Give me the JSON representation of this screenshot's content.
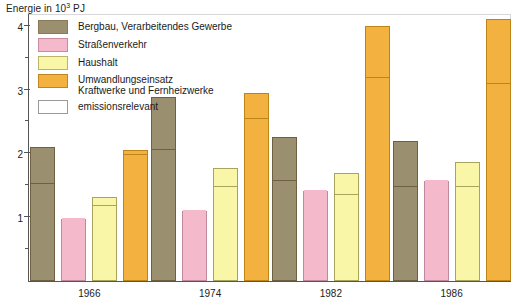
{
  "axis": {
    "y_title_prefix": "Energie in 10",
    "y_title_sup": "3",
    "y_title_suffix": " PJ",
    "y_ticks": [
      "1",
      "2",
      "3",
      "4"
    ]
  },
  "legend": {
    "items": [
      {
        "label": "Bergbau, Verarbeitendes Gewerbe",
        "color": "#9a8f6e",
        "swatch": "s-bergbau"
      },
      {
        "label": "Straßenverkehr",
        "color": "#f4b9cb",
        "swatch": "s-strasse"
      },
      {
        "label": "Haushalt",
        "color": "#faf6a8",
        "swatch": "s-haushalt"
      },
      {
        "label": "Umwandlungseinsatz\nKraftwerke und Fernheizwerke",
        "color": "#f3b13f",
        "swatch": "s-umwandlung"
      },
      {
        "label": "emissionsrelevant",
        "color": "#ffffff",
        "swatch": "s-emiss"
      }
    ]
  },
  "chart_data": {
    "type": "bar",
    "title": "",
    "xlabel": "",
    "ylabel": "Energie in 10^3 PJ",
    "ylim": [
      0,
      4.2
    ],
    "grid": false,
    "legend_position": "top-left",
    "categories": [
      "1966",
      "1974",
      "1982",
      "1986"
    ],
    "series": [
      {
        "name": "Bergbau, Verarbeitendes Gewerbe",
        "color": "#9a8f6e",
        "values": [
          2.1,
          2.89,
          2.25,
          2.19
        ],
        "emissions_relevant": [
          1.5,
          2.03,
          1.55,
          1.45
        ]
      },
      {
        "name": "Straßenverkehr",
        "color": "#f4b9cb",
        "values": [
          0.97,
          1.1,
          1.41,
          1.56
        ],
        "emissions_relevant": [
          0.97,
          1.1,
          1.41,
          1.56
        ]
      },
      {
        "name": "Haushalt",
        "color": "#faf6a8",
        "values": [
          1.31,
          1.77,
          1.7,
          1.87
        ],
        "emissions_relevant": [
          1.16,
          1.45,
          1.34,
          1.45
        ]
      },
      {
        "name": "Umwandlungseinsatz Kraftwerke und Fernheizwerke",
        "color": "#f3b13f",
        "values": [
          2.06,
          2.94,
          3.99,
          4.1
        ],
        "emissions_relevant": [
          1.96,
          2.52,
          3.17,
          3.07
        ]
      }
    ]
  }
}
